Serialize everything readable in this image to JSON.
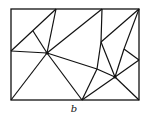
{
  "figure": {
    "caption": "b",
    "stroke_color": "#111111",
    "background": "#ffffff",
    "rectangle": {
      "x1": 11,
      "y1": 9,
      "x2": 139,
      "y2": 100
    },
    "vertices": {
      "TL": [
        11,
        9
      ],
      "TR": [
        139,
        9
      ],
      "BL": [
        11,
        100
      ],
      "BR": [
        139,
        100
      ],
      "T1": [
        56,
        9
      ],
      "T2": [
        102,
        9
      ],
      "L": [
        11,
        51
      ],
      "A": [
        33,
        31
      ],
      "P": [
        47,
        53
      ],
      "B": [
        82,
        100
      ],
      "Q": [
        97,
        69
      ],
      "S": [
        101,
        42
      ],
      "T": [
        124,
        49
      ],
      "R": [
        115,
        77
      ],
      "U": [
        139,
        60
      ]
    },
    "edges": [
      [
        "L",
        "T1"
      ],
      [
        "A",
        "P"
      ],
      [
        "T1",
        "P"
      ],
      [
        "L",
        "P"
      ],
      [
        "P",
        "T2"
      ],
      [
        "P",
        "BL"
      ],
      [
        "P",
        "B"
      ],
      [
        "P",
        "Q"
      ],
      [
        "Q",
        "B"
      ],
      [
        "Q",
        "R"
      ],
      [
        "T2",
        "S"
      ],
      [
        "S",
        "Q"
      ],
      [
        "S",
        "TR"
      ],
      [
        "S",
        "R"
      ],
      [
        "TR",
        "T"
      ],
      [
        "T",
        "R"
      ],
      [
        "T",
        "U"
      ],
      [
        "U",
        "R"
      ],
      [
        "R",
        "BR"
      ],
      [
        "R",
        "B"
      ]
    ]
  }
}
